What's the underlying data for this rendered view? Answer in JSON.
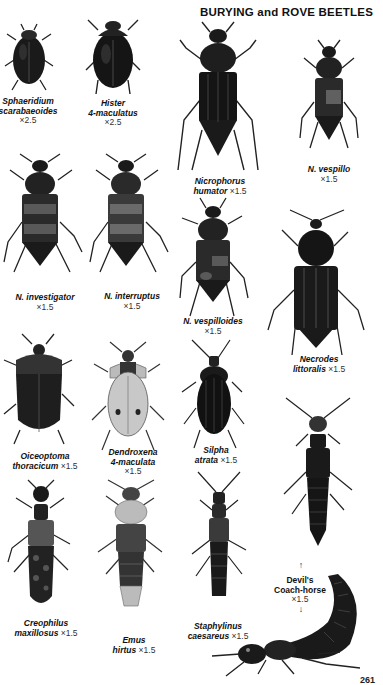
{
  "page": {
    "title": "BURYING and ROVE BEETLES",
    "page_number": "261"
  },
  "specimens": [
    {
      "genus_line": "Sphaeridium",
      "species_line": "scarabaeoides",
      "scale": "×2.5"
    },
    {
      "genus_line": "Hister",
      "species_line": "4-maculatus",
      "scale": "×2.5"
    },
    {
      "genus_line": "Nicrophorus",
      "species_line": "humator",
      "scale": "×1.5"
    },
    {
      "genus_line": "N. vespillo",
      "species_line": "",
      "scale": "×1.5"
    },
    {
      "genus_line": "N. investigator",
      "species_line": "",
      "scale": "×1.5"
    },
    {
      "genus_line": "N. interruptus",
      "species_line": "",
      "scale": "×1.5"
    },
    {
      "genus_line": "N. vespilloides",
      "species_line": "",
      "scale": "×1.5"
    },
    {
      "genus_line": "Necrodes",
      "species_line": "littoralis",
      "scale": "×1.5"
    },
    {
      "genus_line": "Oiceoptoma",
      "species_line": "thoracicum",
      "scale": "×1.5"
    },
    {
      "genus_line": "Dendroxena",
      "species_line": "4-maculata",
      "scale": "×1.5"
    },
    {
      "genus_line": "Silpha",
      "species_line": "atrata",
      "scale": "×1.5"
    },
    {
      "genus_line": "Creophilus",
      "species_line": "maxillosus",
      "scale": "×1.5"
    },
    {
      "genus_line": "Emus",
      "species_line": "hirtus",
      "scale": "×1.5"
    },
    {
      "genus_line": "Staphylinus",
      "species_line": "caesareus",
      "scale": "×1.5"
    },
    {
      "genus_line": "Devil's",
      "species_line": "Coach-horse",
      "scale": "×1.5"
    }
  ],
  "arrows": {
    "up": "↑",
    "down": "↓"
  }
}
